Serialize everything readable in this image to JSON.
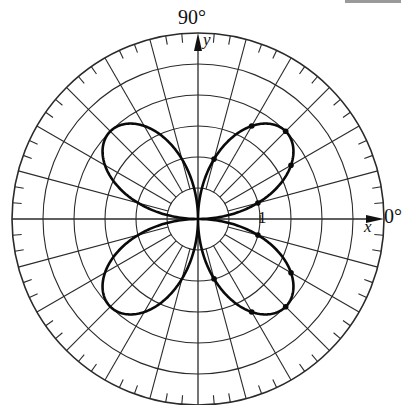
{
  "figure": {
    "labels": {
      "angle_top": "90°",
      "angle_right": "0°",
      "x_axis": "x",
      "y_axis": "y",
      "unit_mark": "1"
    },
    "colors": {
      "grid": "#2a2a2a",
      "curve": "#0a0a0a",
      "background": "#ffffff"
    }
  },
  "chart_data": {
    "type": "polar-line",
    "equation": "r = 2 sin(2θ)",
    "radial_rings": [
      0.5,
      1,
      1.5,
      2,
      2.5,
      3
    ],
    "spoke_step_deg": 15,
    "outer_tick_step_deg": 5,
    "angle_labels": [
      "0°",
      "90°"
    ],
    "axis_labels": {
      "x": "x",
      "y": "y"
    },
    "radial_tick_label": "1",
    "marked_points": [
      {
        "theta_deg": 15,
        "r": 1.0
      },
      {
        "theta_deg": 30,
        "r": 1.73
      },
      {
        "theta_deg": 45,
        "r": 2.0
      },
      {
        "theta_deg": 60,
        "r": 1.73
      },
      {
        "theta_deg": 75,
        "r": 1.0
      },
      {
        "theta_deg": 285,
        "r": 1.0
      },
      {
        "theta_deg": 300,
        "r": 1.73
      },
      {
        "theta_deg": 315,
        "r": 2.0
      },
      {
        "theta_deg": 330,
        "r": 1.73
      },
      {
        "theta_deg": 345,
        "r": 1.0
      }
    ],
    "petals": 4,
    "petal_directions_deg": [
      45,
      135,
      225,
      315
    ],
    "max_r": 2
  }
}
